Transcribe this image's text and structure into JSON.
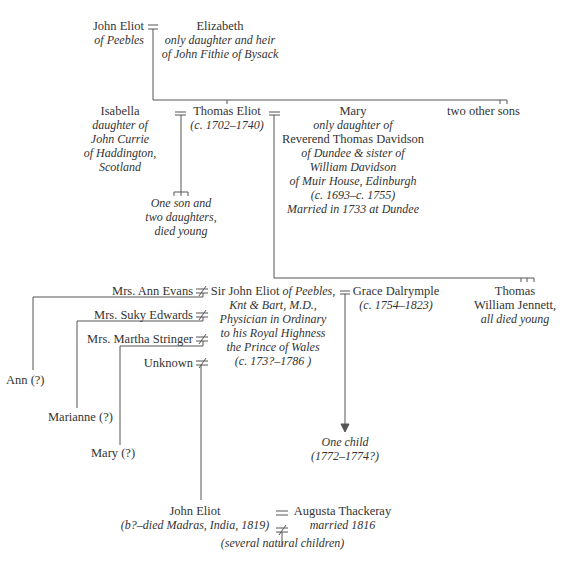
{
  "tree": {
    "gen1": {
      "husband": {
        "name": "John Eliot",
        "desc": [
          "of Peebles"
        ]
      },
      "wife": {
        "name": "Elizabeth",
        "desc": [
          "only daughter and heir",
          "of John Fithie of Bysack"
        ]
      }
    },
    "gen2": {
      "thomas": {
        "name": "Thomas Eliot",
        "dates": "(c. 1702–1740)"
      },
      "wife1": {
        "name": "Isabella",
        "desc": [
          "daughter of",
          "John Currie",
          "of Haddington,",
          "Scotland"
        ]
      },
      "wife1_children": [
        "One son and",
        "two daughters,",
        "died young"
      ],
      "wife2": {
        "name": "Mary",
        "desc_lines": [
          "only daughter of",
          "Reverend Thomas Davidson",
          "of Dundee & sister of",
          "William Davidson",
          "of Muir House, Edinburgh",
          "(c. 1693–c. 1755)",
          "Married in 1733 at Dundee"
        ]
      },
      "siblings": "two other sons"
    },
    "gen3": {
      "sir_john": {
        "name": "Sir John Eliot",
        "suffix": "of Peebles,",
        "desc": [
          "Knt & Bart, M.D.,",
          "Physician in Ordinary",
          "to his Royal Highness",
          "the Prince of Wales",
          "(c. 173?–1786 )"
        ]
      },
      "wife": {
        "name": "Grace Dalrymple",
        "dates": "(c. 1754–1823)"
      },
      "siblings": {
        "names": [
          "Thomas",
          "William Jennett,"
        ],
        "note": "all died young"
      },
      "partners": [
        "Mrs. Ann Evans",
        "Mrs. Suky Edwards",
        "Mrs. Martha Stringer",
        "Unknown"
      ]
    },
    "gen4": {
      "illegitimate": [
        "Ann (?)",
        "Marianne (?)",
        "Mary (?)"
      ],
      "grace_child": [
        "One child",
        "(1772–1774?)"
      ],
      "john": {
        "name": "John Eliot",
        "dates": "(b?–died Madras, India, 1819)"
      },
      "john_wife": {
        "name": "Augusta Thackeray",
        "note": "married 1816"
      },
      "john_children": "(several natural children)"
    },
    "symbols": {
      "marriage": "═",
      "liaison": "≠"
    }
  }
}
